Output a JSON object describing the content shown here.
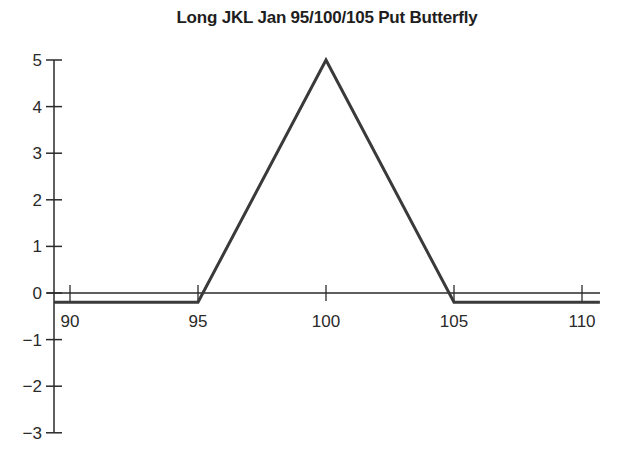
{
  "chart_data": {
    "type": "line",
    "title": "Long JKL Jan 95/100/105 Put Butterfly",
    "xlabel": "",
    "ylabel": "",
    "x_ticks": [
      90,
      95,
      100,
      105,
      110
    ],
    "y_ticks": [
      5,
      4,
      3,
      2,
      1,
      0,
      -1,
      -2,
      -3
    ],
    "y_tick_labels": [
      "5",
      "4",
      "3",
      "2",
      "1",
      "0",
      "−1",
      "−2",
      "−3"
    ],
    "xlim": [
      88.5,
      110.7
    ],
    "ylim": [
      -3,
      5
    ],
    "grid": false,
    "legend": null,
    "series": [
      {
        "name": "Payoff",
        "x": [
          89.3,
          95,
          100,
          105,
          110.7
        ],
        "y": [
          -0.2,
          -0.2,
          5,
          -0.2,
          -0.2
        ],
        "color": "#3a3a3a"
      }
    ]
  }
}
